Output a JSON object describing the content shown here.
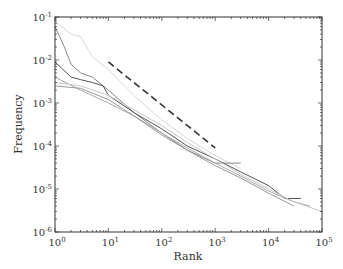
{
  "chart_data": {
    "type": "line",
    "title": "",
    "xlabel": "Rank",
    "ylabel": "Frequency",
    "xscale": "log",
    "yscale": "log",
    "xlim": [
      1,
      100000
    ],
    "ylim": [
      1e-06,
      0.1
    ],
    "x_tick_labels": [
      "10^0",
      "10^1",
      "10^2",
      "10^3",
      "10^4",
      "10^5"
    ],
    "y_tick_labels": [
      "10^-6",
      "10^-5",
      "10^-4",
      "10^-3",
      "10^-2",
      "10^-1"
    ],
    "grid": false,
    "legend": null,
    "series": [
      {
        "name": "series-1",
        "color": "#d8d8d8",
        "points": [
          [
            1,
            0.08
          ],
          [
            2,
            0.04
          ],
          [
            3,
            0.035
          ],
          [
            5,
            0.012
          ],
          [
            10,
            0.006
          ],
          [
            30,
            0.0015
          ],
          [
            100,
            0.0004
          ],
          [
            300,
            0.00015
          ],
          [
            1000,
            6e-05
          ],
          [
            3000,
            3e-05
          ]
        ]
      },
      {
        "name": "series-2",
        "color": "#888888",
        "points": [
          [
            1,
            0.06
          ],
          [
            1.5,
            0.02
          ],
          [
            2,
            0.008
          ],
          [
            3,
            0.005
          ],
          [
            5,
            0.004
          ],
          [
            10,
            0.002
          ],
          [
            30,
            0.0006
          ],
          [
            100,
            0.0002
          ],
          [
            300,
            8e-05
          ],
          [
            1000,
            4e-05
          ],
          [
            3000,
            4e-05
          ]
        ]
      },
      {
        "name": "series-3",
        "color": "#555555",
        "points": [
          [
            1,
            0.009
          ],
          [
            2,
            0.004
          ],
          [
            3,
            0.0035
          ],
          [
            5,
            0.003
          ],
          [
            8,
            0.0025
          ],
          [
            10,
            0.0015
          ],
          [
            30,
            0.0006
          ],
          [
            100,
            0.00025
          ],
          [
            300,
            0.0001
          ],
          [
            1000,
            5e-05
          ],
          [
            3000,
            2.5e-05
          ],
          [
            10000,
            1.2e-05
          ],
          [
            20000,
            6e-06
          ],
          [
            40000,
            6e-06
          ]
        ]
      },
      {
        "name": "series-4",
        "color": "#aaaaaa",
        "points": [
          [
            1,
            0.004
          ],
          [
            3,
            0.002
          ],
          [
            10,
            0.001
          ],
          [
            30,
            0.0005
          ],
          [
            100,
            0.0002
          ],
          [
            300,
            9e-05
          ],
          [
            1000,
            4e-05
          ],
          [
            3000,
            2e-05
          ],
          [
            10000,
            9e-06
          ],
          [
            30000,
            5e-06
          ],
          [
            60000,
            4e-06
          ]
        ]
      },
      {
        "name": "series-5",
        "color": "#999999",
        "points": [
          [
            1,
            0.0025
          ],
          [
            3,
            0.0022
          ],
          [
            10,
            0.0012
          ],
          [
            30,
            0.0005
          ],
          [
            100,
            0.00018
          ],
          [
            300,
            8e-05
          ],
          [
            1000,
            3.5e-05
          ],
          [
            3000,
            1.8e-05
          ],
          [
            10000,
            8e-06
          ],
          [
            30000,
            4e-06
          ]
        ]
      },
      {
        "name": "series-6",
        "color": "#c8c8c8",
        "points": [
          [
            1,
            0.003
          ],
          [
            3,
            0.0025
          ],
          [
            10,
            0.0015
          ],
          [
            30,
            0.0007
          ],
          [
            100,
            0.0003
          ],
          [
            300,
            0.00012
          ],
          [
            1000,
            5e-05
          ],
          [
            3000,
            2.2e-05
          ],
          [
            10000,
            1e-05
          ],
          [
            30000,
            5e-06
          ],
          [
            100000,
            3e-06
          ]
        ]
      }
    ],
    "reference_line": {
      "style": "dashed",
      "color": "#333333",
      "slope": -1,
      "points": [
        [
          10,
          0.009
        ],
        [
          1000,
          9e-05
        ]
      ]
    }
  }
}
